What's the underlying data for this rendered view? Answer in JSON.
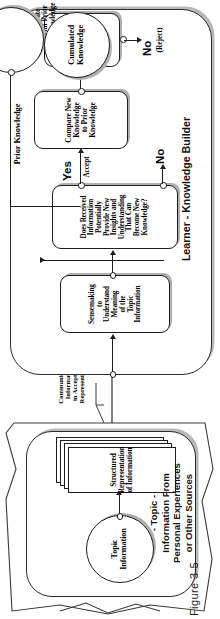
{
  "figure": {
    "caption": "Figure 3-5"
  },
  "lanes": {
    "learner": {
      "label": "Learner - Knowledge Builder",
      "name": "learner-knowledge-builder-lane"
    },
    "topic": {
      "label": "- Topic -\nInformation From\nPersonal Experiences\nor Other Sources",
      "name": "topic-source-lane"
    }
  },
  "nodes": {
    "topic_information": {
      "label": "Topic\nInformation",
      "shape": "circle"
    },
    "structured_representation": {
      "label": "Structured\nRepresentation\nof Information",
      "shape": "document-stack"
    },
    "sensemaking": {
      "label": "Sensemaking\nto\nUnderstand\nMeaning\nof the\nTopic\nInformation",
      "shape": "process"
    },
    "does_received_information": {
      "label": "Does Received\nInformation\nPotentially\nProvide New\nInsights and\nUnderstanding\nThat Can\nBecome New\nKnowledge?",
      "shape": "decision-process"
    },
    "compare_new_knowledge": {
      "label": "Compare New\nKnowledge\nto Prior\nKnowledge",
      "shape": "process"
    },
    "is_new_knowledge_acceptable": {
      "label": "Is New\nKnowledge\nAcceptable?",
      "shape": "decision-process"
    },
    "cumulated_knowledge": {
      "label": "Cumulated\nKnowledge",
      "shape": "circle"
    }
  },
  "edges": {
    "communicated_information": "Communicated\nInformation\nin Acceptable\nRepresentation",
    "prior_knowledge": "Prior Knowledge",
    "yes_accept_1": {
      "big": "Yes",
      "small": "Accept"
    },
    "no_1": {
      "big": "No"
    },
    "yes_accept_2": {
      "big": "Yes",
      "small": "Accept\n&\nIntegrate\nwith Prior\nKnowledge"
    },
    "no_reject": {
      "big": "No",
      "small": "(Reject)"
    }
  },
  "colors": {
    "stroke": "#1d1d1d",
    "shadow": "#b0b0b0",
    "background": "#ffffff"
  }
}
